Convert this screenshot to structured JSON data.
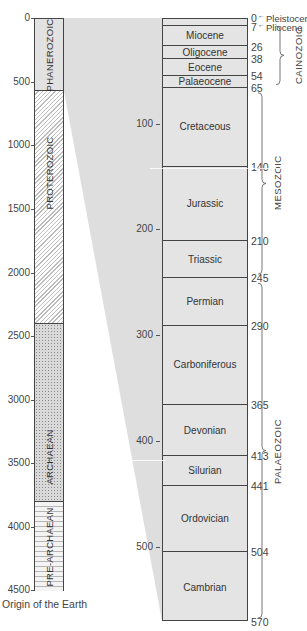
{
  "left_scale": {
    "ticks": [
      {
        "label": "0",
        "y": 18
      },
      {
        "label": "500",
        "y": 82
      },
      {
        "label": "1000",
        "y": 145
      },
      {
        "label": "1500",
        "y": 209
      },
      {
        "label": "2000",
        "y": 273
      },
      {
        "label": "2500",
        "y": 336
      },
      {
        "label": "3000",
        "y": 400
      },
      {
        "label": "3500",
        "y": 463
      },
      {
        "label": "4000",
        "y": 527
      },
      {
        "label": "4500",
        "y": 590
      }
    ],
    "footer": "Origin of the Earth"
  },
  "eons": [
    {
      "name": "PHANEROZOIC",
      "start": 0,
      "end": 570
    },
    {
      "name": "PROTEROZOIC",
      "start": 570,
      "end": 2400
    },
    {
      "name": "ARCHAEAN",
      "start": 2400,
      "end": 3800
    },
    {
      "name": "PRE-ARCHAEAN",
      "start": 3800,
      "end": 4500
    }
  ],
  "right_scale": {
    "ticks": [
      {
        "label": "100",
        "y": 124
      },
      {
        "label": "200",
        "y": 229
      },
      {
        "label": "300",
        "y": 335
      },
      {
        "label": "400",
        "y": 441
      },
      {
        "label": "500",
        "y": 547
      }
    ]
  },
  "periods": [
    {
      "name": "",
      "start": 0,
      "end": 7
    },
    {
      "name": "Miocene",
      "start": 7,
      "end": 26
    },
    {
      "name": "Oligocene",
      "start": 26,
      "end": 38
    },
    {
      "name": "Eocene",
      "start": 38,
      "end": 54
    },
    {
      "name": "Palaeocene",
      "start": 54,
      "end": 65
    },
    {
      "name": "Cretaceous",
      "start": 65,
      "end": 140
    },
    {
      "name": "Jurassic",
      "start": 140,
      "end": 210
    },
    {
      "name": "Triassic",
      "start": 210,
      "end": 245
    },
    {
      "name": "Permian",
      "start": 245,
      "end": 290
    },
    {
      "name": "Carboniferous",
      "start": 290,
      "end": 365
    },
    {
      "name": "Devonian",
      "start": 365,
      "end": 413
    },
    {
      "name": "Silurian",
      "start": 413,
      "end": 441
    },
    {
      "name": "Ordovician",
      "start": 441,
      "end": 504
    },
    {
      "name": "Cambrian",
      "start": 504,
      "end": 570
    }
  ],
  "boundary_ages": [
    "0",
    "7",
    "26",
    "38",
    "54",
    "65",
    "140",
    "210",
    "245",
    "290",
    "365",
    "413",
    "441",
    "504",
    "570"
  ],
  "epoch_callouts": [
    {
      "age": "0",
      "label": "Pleistocene"
    },
    {
      "age": "7",
      "label": "Pliocene"
    }
  ],
  "eras": [
    {
      "name": "CAINOZOIC",
      "start": 0,
      "end": 65
    },
    {
      "name": "MESOZOIC",
      "start": 65,
      "end": 245
    },
    {
      "name": "PALAEOZOIC",
      "start": 245,
      "end": 570
    }
  ],
  "colors": {
    "column_fill": "#e4e4e4",
    "wedge_fill": "#dcdcdc",
    "border": "#444444",
    "text": "#3a3a3a"
  }
}
